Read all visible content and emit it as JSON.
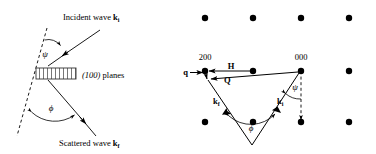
{
  "figure": {
    "background_color": "#ffffff",
    "stroke_color": "#000000",
    "width": 376,
    "height": 154
  },
  "left_panel": {
    "name": "real-space-bragg-scattering",
    "incident_label_text": "Incident wave ",
    "incident_label_symbol": "k",
    "incident_label_subscript": "i",
    "scattered_label_text": "Scattered wave ",
    "scattered_label_symbol": "k",
    "scattered_label_subscript": "f",
    "planes_label_indices": "(100)",
    "planes_label_text": " planes",
    "angle_psi": "ψ",
    "angle_phi": "ϕ"
  },
  "right_panel": {
    "name": "reciprocal-space-ewald-construction",
    "node_label_200": "200",
    "node_label_000": "000",
    "vector_H": "H",
    "vector_Q": "Q",
    "vector_q": "q",
    "vector_kf_symbol": "k",
    "vector_kf_subscript": "f",
    "vector_ki_symbol": "k",
    "vector_ki_subscript": "i",
    "angle_psi": "ψ",
    "angle_phi": "ϕ",
    "lattice": {
      "columns_x": [
        205,
        253,
        301,
        349
      ],
      "rows_y": [
        18,
        71,
        122
      ],
      "dot_radius": 3.2
    }
  }
}
